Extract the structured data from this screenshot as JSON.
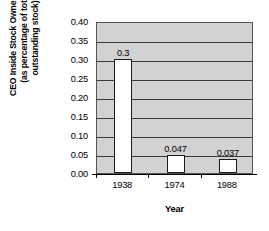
{
  "chart_data": {
    "type": "bar",
    "title": "",
    "subtitle": "",
    "xlabel": "Year",
    "ylabel": "CEO Inside Stock Ownership\n(as percentage of total\noutstanding stock)",
    "categories": [
      "1938",
      "1974",
      "1988"
    ],
    "values": [
      0.3,
      0.047,
      0.037
    ],
    "data_labels": [
      "0.3",
      "0.047",
      "0.037"
    ],
    "ylim": [
      0.0,
      0.4
    ],
    "ytick_step": 0.05,
    "ytick_labels": [
      "0.40",
      "0.35",
      "0.30",
      "0.25",
      "0.20",
      "0.15",
      "0.10",
      "0.05",
      "0.00"
    ],
    "ytick_values": [
      0.4,
      0.35,
      0.3,
      0.25,
      0.2,
      0.15,
      0.1,
      0.05,
      0.0
    ],
    "grid": true,
    "grid_axis": "y",
    "legend": false,
    "legend_position": "none",
    "series": [
      {
        "name": "CEO Inside Stock Ownership",
        "values": [
          0.3,
          0.047,
          0.037
        ]
      }
    ],
    "colors": {
      "plot_background": "#d2d2d2",
      "bar_fill": "#ffffff",
      "bar_edge": "#1a1a1a",
      "gridline": "#3a3a3a",
      "axis": "#000000",
      "text": "#000000",
      "page_background": "#ffffff"
    }
  }
}
